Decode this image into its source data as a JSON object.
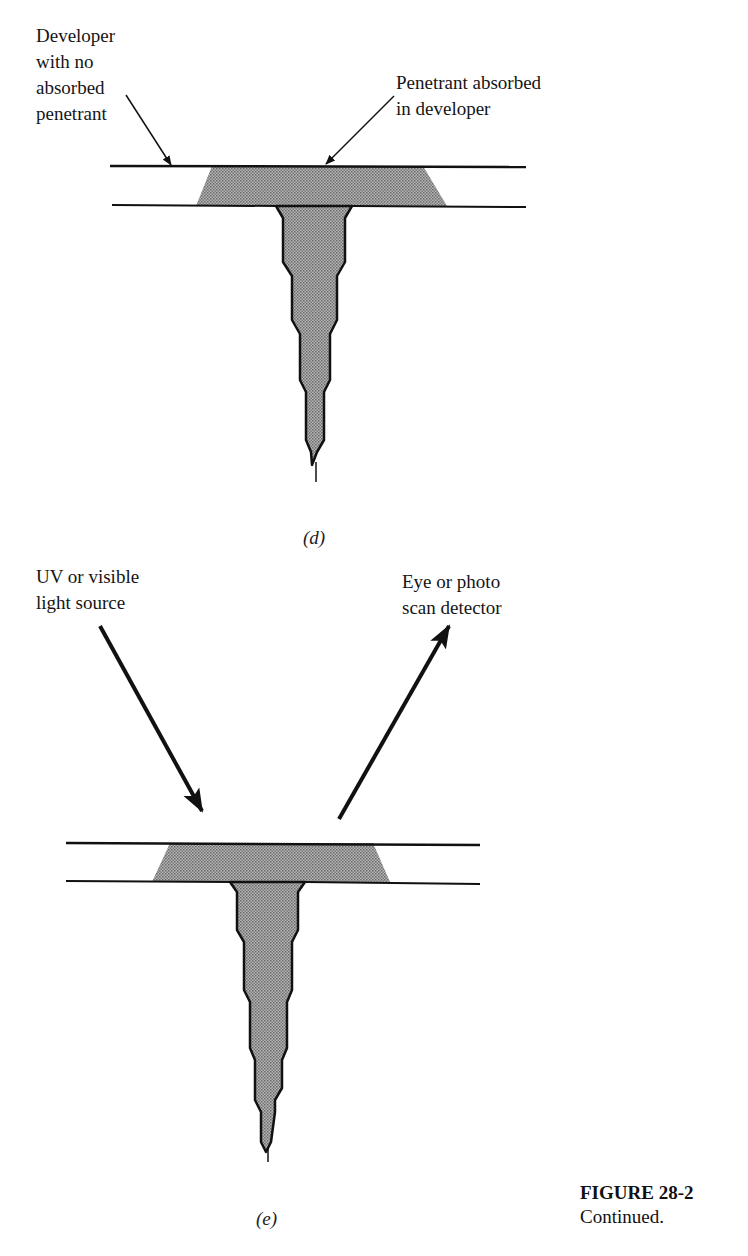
{
  "panel_d": {
    "label_left": "Developer\nwith no\nabsorbed\npenetrant",
    "label_right": "Penetrant absorbed\nin developer",
    "sublabel": "(d)"
  },
  "panel_e": {
    "label_left": "UV or visible\nlight source",
    "label_right": "Eye or photo\nscan detector",
    "sublabel": "(e)"
  },
  "caption": {
    "title": "FIGURE 28-2",
    "text": "Continued."
  },
  "colors": {
    "fill": "#9a9a9a",
    "stroke": "#111111"
  }
}
